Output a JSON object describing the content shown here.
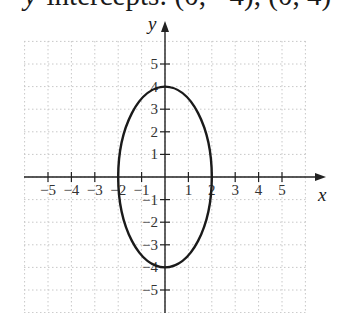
{
  "title": {
    "prefix_var": "y",
    "text": "-intercepts: (0, −4), (0, 4)"
  },
  "chart_data": {
    "type": "line",
    "title": "y-intercepts: (0, −4), (0, 4)",
    "xlabel": "x",
    "ylabel": "y",
    "xlim": [
      -6,
      6
    ],
    "ylim": [
      -6,
      6
    ],
    "grid": true,
    "grid_style": "dotted",
    "x_ticks": [
      -5,
      -4,
      -3,
      -2,
      -1,
      1,
      2,
      3,
      4,
      5
    ],
    "y_ticks": [
      -5,
      -4,
      -3,
      -2,
      -1,
      1,
      2,
      3,
      4,
      5
    ],
    "x_tick_labels": [
      "−5",
      "−4",
      "−3",
      "−2",
      "−1",
      "1",
      "2",
      "3",
      "4",
      "5"
    ],
    "y_tick_labels": [
      "−5",
      "−4",
      "−3",
      "−2",
      "−1",
      "1",
      "2",
      "3",
      "4",
      "5"
    ],
    "series": [
      {
        "name": "ellipse",
        "shape": "ellipse",
        "equation": "x^2/4 + y^2/16 = 1",
        "center": [
          0,
          0
        ],
        "semi_axis_x": 2,
        "semi_axis_y": 4,
        "key_points": [
          [
            -2,
            0
          ],
          [
            2,
            0
          ],
          [
            0,
            -4
          ],
          [
            0,
            4
          ]
        ],
        "color": "#1a1a1a"
      }
    ]
  },
  "layout": {
    "origin_px": [
      165,
      177
    ],
    "unit_px_x": 23.4,
    "unit_px_y": 22.6,
    "grid_left": 24,
    "grid_right": 307,
    "grid_top": 41,
    "grid_bottom": 313
  }
}
